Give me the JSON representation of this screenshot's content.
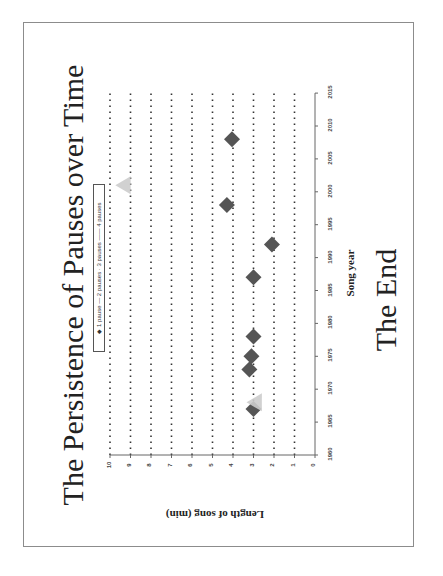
{
  "page": {
    "title": "The Persistence of Pauses over Time",
    "footer_text": "The End"
  },
  "chart_data": {
    "type": "scatter",
    "title": "The Persistence of Pauses over Time",
    "xlabel": "Song year",
    "ylabel": "Length of song (min)",
    "xlim": [
      1960,
      2015
    ],
    "ylim": [
      0,
      10
    ],
    "x_ticks": [
      1960,
      1965,
      1970,
      1975,
      1980,
      1985,
      1990,
      1995,
      2000,
      2005,
      2010,
      2015
    ],
    "y_ticks": [
      0,
      1,
      2,
      3,
      4,
      5,
      6,
      7,
      8,
      9,
      10
    ],
    "grid": "horizontal dotted lines at each y tick",
    "orientation": "page rotated 90° counter-clockwise",
    "legend": {
      "position": "top-left inside plot",
      "entries": [
        "1 pause",
        "2 pauses",
        "3 pauses",
        "4 pauses"
      ]
    },
    "series": [
      {
        "name": "1 pause",
        "marker": "diamond",
        "color": "#555555",
        "points": [
          {
            "x": 1967,
            "y": 3.0
          },
          {
            "x": 1973,
            "y": 3.2
          },
          {
            "x": 1975,
            "y": 3.1
          },
          {
            "x": 1978,
            "y": 3.0
          },
          {
            "x": 1987,
            "y": 3.0
          },
          {
            "x": 1992,
            "y": 2.1
          },
          {
            "x": 1998,
            "y": 4.3
          },
          {
            "x": 2008,
            "y": 4.05
          }
        ]
      },
      {
        "name": "3 pauses",
        "marker": "triangle",
        "color": "#cccccc",
        "points": [
          {
            "x": 2001,
            "y": 9.3
          },
          {
            "x": 1968,
            "y": 2.9
          }
        ]
      }
    ]
  }
}
